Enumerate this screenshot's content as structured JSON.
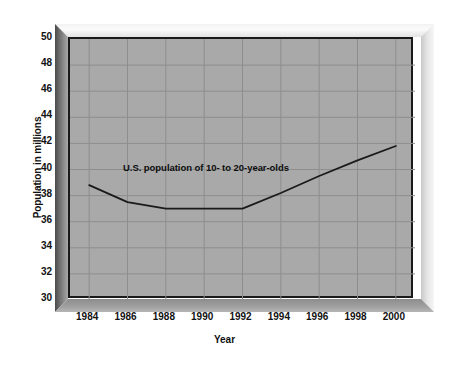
{
  "chart_data": {
    "type": "line",
    "title": "",
    "xlabel": "Year",
    "ylabel": "Population in millions",
    "xlim": [
      1983,
      2001
    ],
    "ylim": [
      30,
      50
    ],
    "grid": true,
    "legend": "none",
    "annotations": [
      {
        "text": "U.S. population of 10- to 20-year-olds",
        "x": 1990.2,
        "y": 40.0
      }
    ],
    "xticks": [
      "1984",
      "1986",
      "1988",
      "1990",
      "1992",
      "1994",
      "1996",
      "1998",
      "2000"
    ],
    "xtick_values": [
      1984,
      1986,
      1988,
      1990,
      1992,
      1994,
      1996,
      1998,
      2000
    ],
    "yticks": [
      "50",
      "48",
      "46",
      "44",
      "42",
      "40",
      "38",
      "36",
      "34",
      "32",
      "30"
    ],
    "ytick_values": [
      50,
      48,
      46,
      44,
      42,
      40,
      38,
      36,
      34,
      32,
      30
    ],
    "series": [
      {
        "name": "U.S. population of 10- to 20-year-olds",
        "color": "#1a1a1a",
        "x": [
          1984,
          1986,
          1988,
          1990,
          1992,
          1994,
          1996,
          1998,
          2000
        ],
        "values": [
          38.8,
          37.5,
          37.0,
          37.0,
          37.0,
          38.2,
          39.5,
          40.7,
          41.8
        ]
      }
    ],
    "colors": {
      "plot_background": "#a9a9a9",
      "grid": "#8e8e8e",
      "axis": "#1a1a1a",
      "line": "#1a1a1a",
      "text": "#111111",
      "page_background": "#ffffff"
    }
  }
}
